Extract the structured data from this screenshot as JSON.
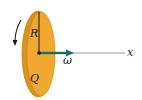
{
  "diagram": {
    "labels": {
      "radius": "R",
      "charge": "Q",
      "angular_velocity": "ω",
      "axis": "x"
    },
    "colors": {
      "disk_fill": "#f0a830",
      "disk_edge": "#c9861a",
      "rim": "#d8921f",
      "omega_arrow": "#1e6b6b",
      "axis_line": "#9a9a9a",
      "ink": "#1a1a1a"
    }
  }
}
